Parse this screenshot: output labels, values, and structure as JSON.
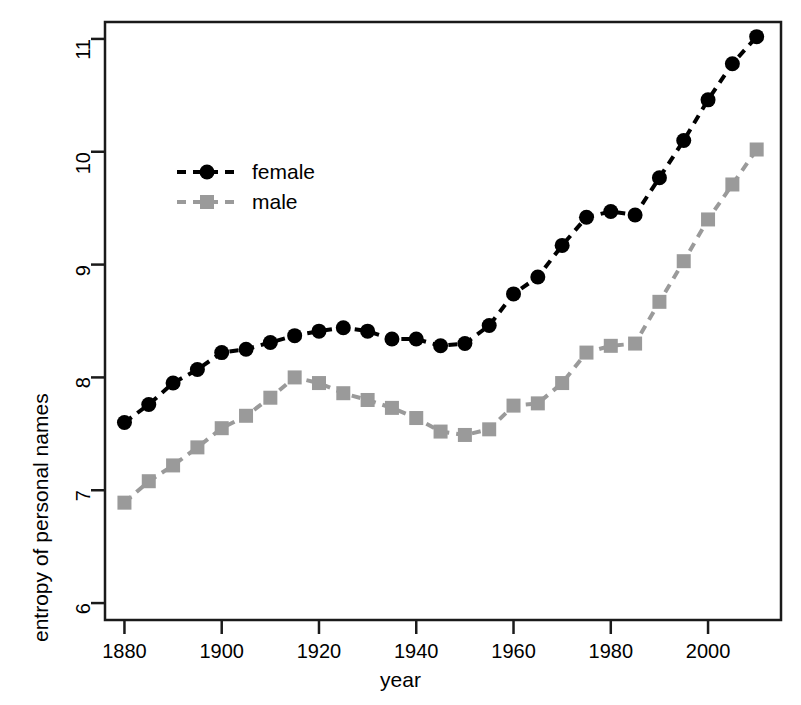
{
  "chart_data": {
    "type": "line",
    "title": "",
    "xlabel": "year",
    "ylabel": "entropy of personal names",
    "xlim": [
      1876,
      2015
    ],
    "ylim": [
      5.85,
      11.15
    ],
    "xticks": [
      1880,
      1900,
      1920,
      1940,
      1960,
      1980,
      2000
    ],
    "yticks": [
      6,
      7,
      8,
      9,
      10,
      11
    ],
    "grid": false,
    "legend_position": "upper left",
    "x": [
      1880,
      1885,
      1890,
      1895,
      1900,
      1905,
      1910,
      1915,
      1920,
      1925,
      1930,
      1935,
      1940,
      1945,
      1950,
      1955,
      1960,
      1965,
      1970,
      1975,
      1980,
      1985,
      1990,
      1995,
      2000,
      2005,
      2010
    ],
    "series": [
      {
        "name": "female",
        "color": "#000000",
        "marker": "circle",
        "values": [
          7.6,
          7.76,
          7.95,
          8.07,
          8.22,
          8.25,
          8.31,
          8.37,
          8.41,
          8.44,
          8.41,
          8.34,
          8.34,
          8.28,
          8.3,
          8.46,
          8.74,
          8.89,
          9.17,
          9.42,
          9.47,
          9.44,
          9.77,
          10.1,
          10.46,
          10.78,
          11.02
        ]
      },
      {
        "name": "male",
        "color": "#9a9a9a",
        "marker": "square",
        "values": [
          6.89,
          7.08,
          7.22,
          7.38,
          7.55,
          7.66,
          7.82,
          8.0,
          7.95,
          7.86,
          7.8,
          7.73,
          7.64,
          7.52,
          7.49,
          7.54,
          7.75,
          7.77,
          7.95,
          8.22,
          8.28,
          8.3,
          8.67,
          9.03,
          9.4,
          9.71,
          10.02
        ]
      }
    ]
  },
  "legend": {
    "items": [
      {
        "label": "female"
      },
      {
        "label": "male"
      }
    ]
  },
  "axes": {
    "x_tick_labels": [
      "1880",
      "1900",
      "1920",
      "1940",
      "1960",
      "1980",
      "2000"
    ],
    "y_tick_labels": [
      "6",
      "7",
      "8",
      "9",
      "10",
      "11"
    ],
    "x_axis_title": "year",
    "y_axis_title": "entropy of personal names"
  },
  "colors": {
    "female": "#000000",
    "male": "#9a9a9a",
    "frame": "#1a1a1a",
    "background": "#ffffff"
  }
}
